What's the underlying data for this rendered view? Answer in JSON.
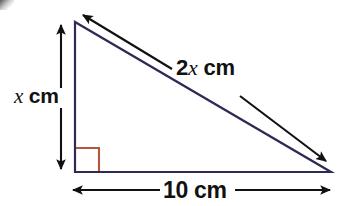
{
  "figure": {
    "kind": "geometry-diagram",
    "background_color": "#ffffff",
    "triangle": {
      "stroke_color": "#2b2b55",
      "stroke_width": 2,
      "vertices": {
        "top": [
          75,
          22
        ],
        "bottom_left": [
          75,
          172
        ],
        "bottom_right": [
          331,
          172
        ]
      }
    },
    "right_angle_marker": {
      "color": "#b5563c",
      "at_vertex": "bottom_left",
      "size": 24
    },
    "dimensions": [
      {
        "id": "vertical",
        "name": "x cm",
        "value_text": "x",
        "unit_text": " cm",
        "italic_part": "x",
        "line_color": "#111111",
        "from": [
          61,
          22
        ],
        "to": [
          61,
          172
        ],
        "arrowheads": "both"
      },
      {
        "id": "hypotenuse",
        "name": "2x cm",
        "value_text": "2x",
        "unit_text": " cm",
        "italic_part": "x",
        "prefix_part": "2",
        "line_color": "#111111",
        "from": [
          80,
          13
        ],
        "to": [
          328,
          164
        ],
        "arrowheads": "both"
      },
      {
        "id": "base",
        "name": "10 cm",
        "value_text": "10",
        "unit_text": " cm",
        "line_color": "#111111",
        "from": [
          70,
          190
        ],
        "to": [
          332,
          190
        ],
        "arrowheads": "both"
      }
    ],
    "labels": {
      "vertical_number": "",
      "vertical_var": "x",
      "vertical_unit": "cm",
      "hypotenuse_coefficient": "2",
      "hypotenuse_var": "x",
      "hypotenuse_unit": "cm",
      "base_value": "10",
      "base_unit": "cm"
    }
  }
}
